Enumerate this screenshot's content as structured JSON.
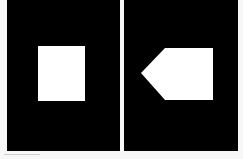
{
  "panels": [
    {
      "name": "left",
      "shape": "square",
      "background": "#000000",
      "shape_color": "#ffffff"
    },
    {
      "name": "right",
      "shape": "pentagon-arrow-left",
      "background": "#000000",
      "shape_color": "#ffffff"
    }
  ],
  "page_background": "#f7f7f7"
}
